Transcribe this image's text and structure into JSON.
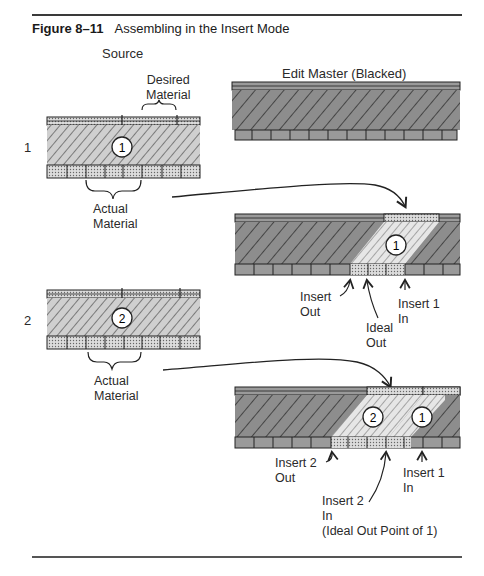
{
  "figure": {
    "number": "Figure 8–11",
    "title": "Assembling in the Insert Mode"
  },
  "columns": {
    "source": "Source",
    "edit_master": "Edit Master (Blacked)"
  },
  "rows": [
    {
      "step": "1",
      "source_clip_number": "1",
      "desired_material": [
        "Desired",
        "Material"
      ],
      "actual_material": [
        "Actual",
        "Material"
      ],
      "result_clips": [
        "1"
      ],
      "annotations": {
        "insert_out": [
          "Insert",
          "Out"
        ],
        "ideal_out": [
          "Ideal",
          "Out"
        ],
        "insert_in": [
          "Insert 1",
          "In"
        ]
      }
    },
    {
      "step": "2",
      "source_clip_number": "2",
      "actual_material": [
        "Actual",
        "Material"
      ],
      "result_clips": [
        "2",
        "1"
      ],
      "annotations": {
        "insert_out": [
          "Insert 2",
          "Out"
        ],
        "insert_in_2": [
          "Insert 2",
          "In",
          "(Ideal Out Point of 1)"
        ],
        "insert_in_1": [
          "Insert 1",
          "In"
        ]
      }
    }
  ]
}
